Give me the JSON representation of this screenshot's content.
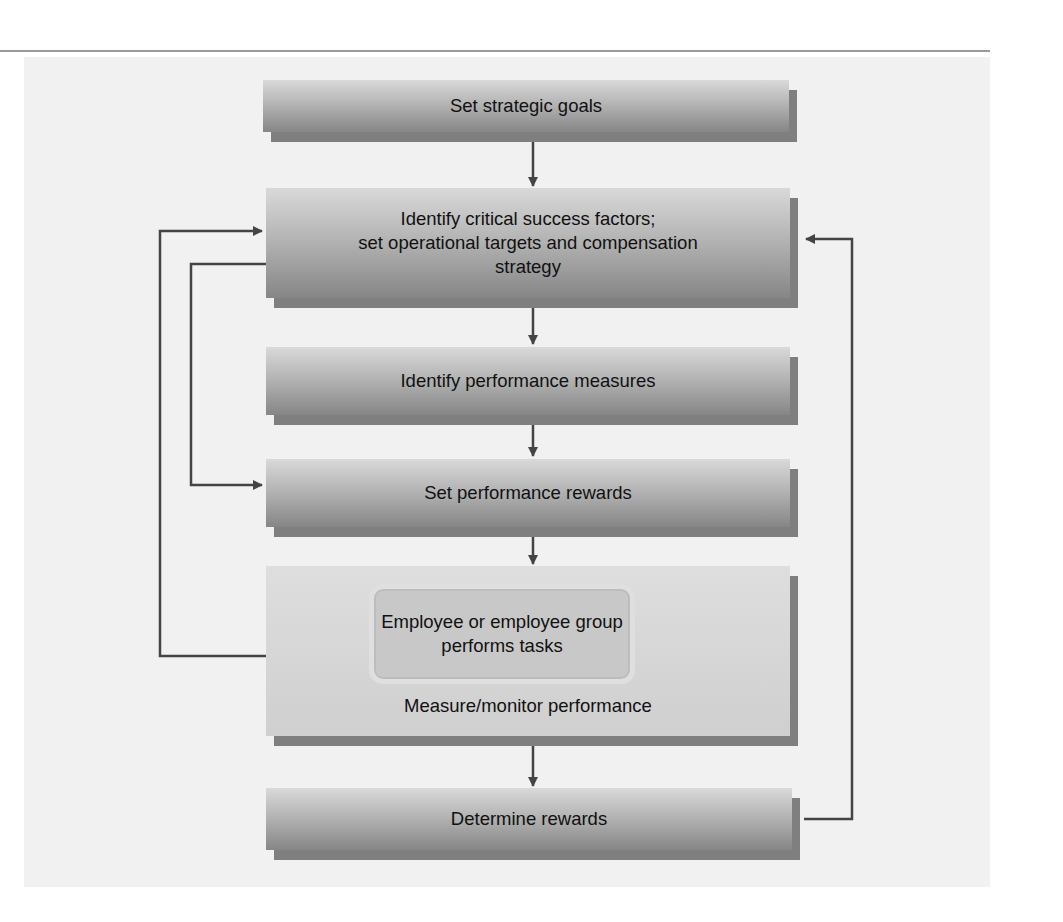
{
  "diagram": {
    "title": "",
    "nodes": [
      {
        "id": "goals",
        "label": "Set strategic goals"
      },
      {
        "id": "csf",
        "label": "Identify critical success factors; set operational targets and compensation strategy",
        "lines": [
          "Identify critical success factors;",
          "set operational targets and compensation",
          "strategy"
        ]
      },
      {
        "id": "measures",
        "label": "Identify performance measures"
      },
      {
        "id": "rewards_set",
        "label": "Set performance rewards"
      },
      {
        "id": "perform",
        "label": "Employee or employee group performs tasks",
        "lines": [
          "Employee or employee group",
          "performs tasks"
        ]
      },
      {
        "id": "monitor",
        "label": "Measure/monitor performance"
      },
      {
        "id": "determine",
        "label": "Determine rewards"
      }
    ],
    "edges": [
      {
        "from": "goals",
        "to": "csf"
      },
      {
        "from": "csf",
        "to": "measures"
      },
      {
        "from": "measures",
        "to": "rewards_set"
      },
      {
        "from": "rewards_set",
        "to": "monitor"
      },
      {
        "from": "monitor",
        "to": "determine"
      },
      {
        "from": "monitor",
        "to": "csf",
        "type": "feedback-left-outer"
      },
      {
        "from": "csf",
        "to": "rewards_set",
        "type": "feedback-left-inner"
      },
      {
        "from": "determine",
        "to": "csf",
        "type": "feedback-right"
      }
    ],
    "colors": {
      "box_top": "#d9d9d9",
      "box_bottom": "#868686",
      "shadow": "#7f7f7f",
      "line": "#444444",
      "panel": "#f1f1f1"
    }
  }
}
